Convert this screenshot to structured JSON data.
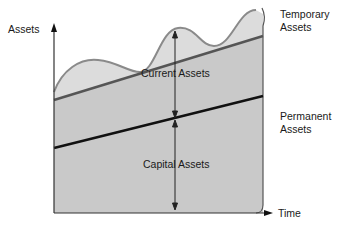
{
  "diagram": {
    "y_axis_label": "Assets",
    "x_axis_label": "Time",
    "region_labels": {
      "current": "Current Assets",
      "capital": "Capital Assets"
    },
    "side_labels": {
      "temporary_line1": "Temporary",
      "temporary_line2": "Assets",
      "permanent_line1": "Permanent",
      "permanent_line2": "Assets"
    },
    "colors": {
      "fill_dark": "#c9c9c9",
      "fill_light": "#dcdcdc",
      "wave_stroke": "#8a8a8a",
      "upper_line": "#555555",
      "capital_line": "#111111",
      "axis": "#333333"
    }
  }
}
